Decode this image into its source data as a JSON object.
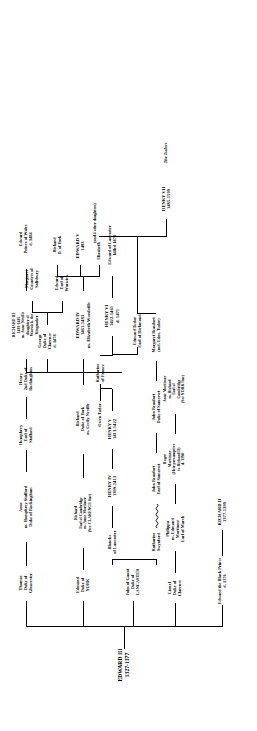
{
  "chart": {
    "root": {
      "name": "EDWARD III",
      "dates": "1327-1377"
    },
    "section_labels": {
      "tudors": "The Tudors"
    },
    "nodes": [
      {
        "id": "edward3",
        "lines": [
          "EDWARD III",
          "1327-1377"
        ]
      },
      {
        "id": "black_prince",
        "lines": [
          "Edward the Black Prince",
          "d. 1376"
        ]
      },
      {
        "id": "richard2",
        "lines": [
          "RICHARD II",
          "1377-1399"
        ]
      },
      {
        "id": "lionel",
        "lines": [
          "Lionel",
          "Duke of",
          "Clarence"
        ]
      },
      {
        "id": "philippa",
        "lines": [
          "Philippa",
          "m. Edmund",
          "Mortimer",
          "Earl of March"
        ]
      },
      {
        "id": "roger",
        "lines": [
          "Roger",
          "Mortimer",
          "(Heir presumptive",
          "to Richard II)",
          "d. 1398"
        ]
      },
      {
        "id": "anne_mortimer",
        "lines": [
          "Anne Mortimer",
          "m. Richard",
          "Earl of",
          "Cambridge",
          "(See YORK line)"
        ]
      },
      {
        "id": "gaunt",
        "lines": [
          "John of Gaunt",
          "Duke of",
          "LANCASTER"
        ]
      },
      {
        "id": "blanche",
        "lines": [
          "Blanche",
          "of Lancaster"
        ]
      },
      {
        "id": "katharine_sw",
        "lines": [
          "Katharine",
          "Swynford"
        ]
      },
      {
        "id": "henry4",
        "lines": [
          "HENRY IV",
          "1399-1413"
        ]
      },
      {
        "id": "john_beaufort",
        "lines": [
          "John Beaufort",
          "Earl of Somerset"
        ]
      },
      {
        "id": "john_beaufort2",
        "lines": [
          "John Beaufort",
          "Duke of Somerset"
        ]
      },
      {
        "id": "henry5",
        "lines": [
          "HENRY V",
          "1413-1422"
        ]
      },
      {
        "id": "margaret_b",
        "lines": [
          "Margaret Beaufort",
          "(md. Edm. Tudor)"
        ]
      },
      {
        "id": "owen_tudor",
        "lines": [
          "Owen Tudor"
        ]
      },
      {
        "id": "katharine_fr",
        "lines": [
          "Katharine",
          "of France"
        ]
      },
      {
        "id": "henry6",
        "lines": [
          "HENRY VI",
          "1422-1461",
          "d. 1471"
        ]
      },
      {
        "id": "edmund_tudor",
        "lines": [
          "Edmund Tudor",
          "Earl of Richmond"
        ]
      },
      {
        "id": "edward_lanc",
        "lines": [
          "Edward of Lancaster",
          "killed 1471"
        ]
      },
      {
        "id": "henry7",
        "lines": [
          "HENRY VII",
          "1485-1509"
        ]
      },
      {
        "id": "edmund_langley",
        "lines": [
          "Edmund",
          "Duke of",
          "YORK"
        ]
      },
      {
        "id": "richard_camb",
        "lines": [
          "Richard",
          "Earl of Cambridge",
          "m. Anne Mortimer",
          "(See CLARENCE line)"
        ]
      },
      {
        "id": "richard_york",
        "lines": [
          "Richard",
          "Duke of York",
          "m. Cecily Neville"
        ]
      },
      {
        "id": "edward4",
        "lines": [
          "EDWARD IV",
          "1461-1483",
          "m. Elizabeth Woodville"
        ]
      },
      {
        "id": "george_clarence",
        "lines": [
          "George",
          "Duke of",
          "Clarence",
          "d. 1478"
        ]
      },
      {
        "id": "richard3",
        "lines": [
          "RICHARD III",
          "1483-1485",
          "m. Anne Neville",
          "daughter of",
          "Warwick, the",
          "Kingmaker"
        ]
      },
      {
        "id": "elizabeth",
        "lines": [
          "Elizabeth"
        ]
      },
      {
        "id": "edward5",
        "lines": [
          "EDWARD V",
          "1483"
        ]
      },
      {
        "id": "richard_dy",
        "lines": [
          "Richard",
          "D. of York"
        ]
      },
      {
        "id": "other_daughters",
        "lines": [
          "(and 4 other daughters)"
        ]
      },
      {
        "id": "edward_warwick",
        "lines": [
          "Edward",
          "Earl of",
          "Warwick"
        ]
      },
      {
        "id": "margaret_salis",
        "lines": [
          "Margaret",
          "Countess of",
          "Salisbury"
        ]
      },
      {
        "id": "edward_pow",
        "lines": [
          "Edward",
          "Prince of Wales",
          "d. 1484"
        ]
      },
      {
        "id": "thomas_glouc",
        "lines": [
          "Thomas",
          "Duke of",
          "Gloucester"
        ]
      },
      {
        "id": "anne_stafford",
        "lines": [
          "Anne",
          "m. Humphrey Stafford",
          "Duke of Buckingham"
        ]
      },
      {
        "id": "humphrey_staff",
        "lines": [
          "Humphrey",
          "Earl of",
          "Stafford"
        ]
      },
      {
        "id": "henry_bucks",
        "lines": [
          "Henry",
          "2nd Duke of",
          "Buckingham"
        ]
      }
    ],
    "colors": {
      "ink": "#000000",
      "paper": "#ffffff"
    }
  }
}
